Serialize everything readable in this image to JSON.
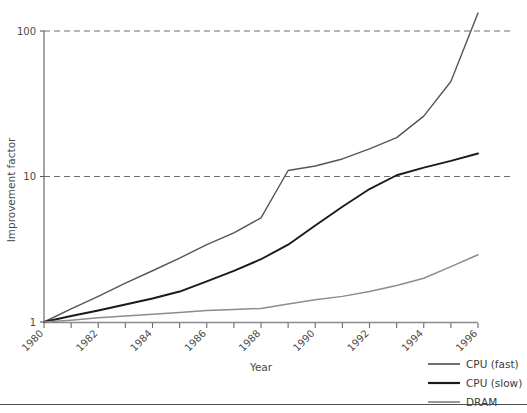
{
  "chart_data": {
    "type": "line",
    "title": "",
    "xlabel": "Year",
    "ylabel": "Improvement factor",
    "yscale": "log",
    "ylim": [
      1,
      150
    ],
    "xlim": [
      1980,
      1996
    ],
    "yticks": [
      1,
      10,
      100
    ],
    "ytick_labels": [
      "1",
      "10",
      "100"
    ],
    "xticks": [
      1980,
      1981,
      1982,
      1983,
      1984,
      1985,
      1986,
      1987,
      1988,
      1989,
      1990,
      1991,
      1992,
      1993,
      1994,
      1995,
      1996
    ],
    "xtick_labels": [
      "1980",
      "",
      "1982",
      "",
      "1984",
      "",
      "1986",
      "",
      "1988",
      "",
      "1990",
      "",
      "1992",
      "",
      "1994",
      "",
      "1996"
    ],
    "xtick_label_rotation": -45,
    "grid": "horizontal-dashed-at-yticks",
    "legend_position": "outside-bottom-right",
    "x": [
      1980,
      1981,
      1982,
      1983,
      1984,
      1985,
      1986,
      1987,
      1988,
      1989,
      1990,
      1991,
      1992,
      1993,
      1994,
      1995,
      1996
    ],
    "series": [
      {
        "name": "CPU (fast)",
        "color": "#555555",
        "width": 1.4,
        "values": [
          1.0,
          1.23,
          1.5,
          1.85,
          2.25,
          2.75,
          3.4,
          4.1,
          5.2,
          11.0,
          11.8,
          13.2,
          15.5,
          18.5,
          26.0,
          45.0,
          133.0
        ]
      },
      {
        "name": "CPU (slow)",
        "color": "#1a1a1a",
        "width": 1.9,
        "values": [
          1.0,
          1.1,
          1.2,
          1.32,
          1.45,
          1.62,
          1.9,
          2.25,
          2.7,
          3.4,
          4.6,
          6.2,
          8.2,
          10.2,
          11.5,
          12.8,
          14.4
        ]
      },
      {
        "name": "DRAM",
        "color": "#8c8c8c",
        "width": 1.5,
        "values": [
          1.0,
          1.03,
          1.07,
          1.1,
          1.13,
          1.16,
          1.2,
          1.22,
          1.24,
          1.33,
          1.42,
          1.5,
          1.62,
          1.78,
          2.0,
          2.4,
          2.9
        ]
      }
    ]
  },
  "axes": {
    "y_title": "Improvement factor",
    "x_title": "Year"
  },
  "legend": {
    "entries": [
      {
        "label": "CPU (fast)"
      },
      {
        "label": "CPU (slow)"
      },
      {
        "label": "DRAM"
      }
    ]
  }
}
